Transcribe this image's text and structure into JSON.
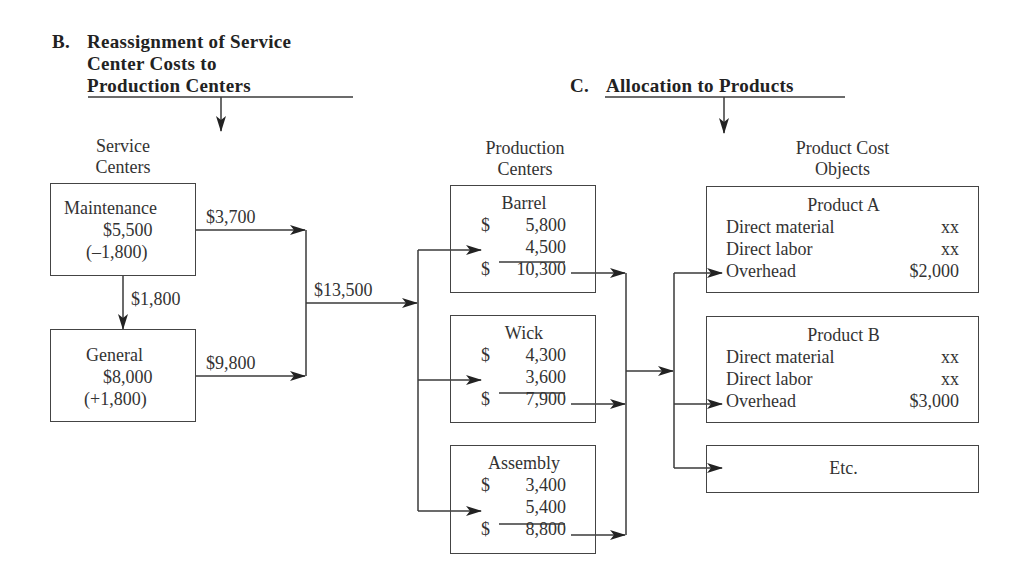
{
  "section_b": {
    "letter": "B.",
    "title_lines": [
      "Reassignment of Service",
      "Center Costs to",
      "Production Centers"
    ]
  },
  "section_c": {
    "letter": "C.",
    "title": "Allocation to Products"
  },
  "columns": {
    "service_centers": [
      "Service",
      "Centers"
    ],
    "production_centers": [
      "Production",
      "Centers"
    ],
    "product_cost_objects": [
      "Product Cost",
      "Objects"
    ]
  },
  "service_centers": [
    {
      "name": "Maintenance",
      "amount": "$5,500",
      "adjustment": "(–1,800)"
    },
    {
      "name": "General",
      "amount": "$8,000",
      "adjustment": "(+1,800)"
    }
  ],
  "flows": {
    "maintenance_to_general": "$1,800",
    "maintenance_to_production": "$3,700",
    "general_to_production": "$9,800",
    "total_to_production": "$13,500"
  },
  "production_centers": [
    {
      "name": "Barrel",
      "dollar1": "$",
      "direct": "5,800",
      "allocated": "4,500",
      "dollar2": "$",
      "total": "10,300"
    },
    {
      "name": "Wick",
      "dollar1": "$",
      "direct": "4,300",
      "allocated": "3,600",
      "dollar2": "$",
      "total": "7,900"
    },
    {
      "name": "Assembly",
      "dollar1": "$",
      "direct": "3,400",
      "allocated": "5,400",
      "dollar2": "$",
      "total": "8,800"
    }
  ],
  "products": [
    {
      "name": "Product A",
      "rows": [
        {
          "label": "Direct material",
          "value": "xx"
        },
        {
          "label": "Direct labor",
          "value": "xx"
        },
        {
          "label": "Overhead",
          "value": "$2,000"
        }
      ]
    },
    {
      "name": "Product B",
      "rows": [
        {
          "label": "Direct material",
          "value": "xx"
        },
        {
          "label": "Direct labor",
          "value": "xx"
        },
        {
          "label": "Overhead",
          "value": "$3,000"
        }
      ]
    }
  ],
  "etc_box": {
    "label": "Etc."
  },
  "colors": {
    "line": "#3a3a3a",
    "text": "#2a2a2a",
    "background": "#ffffff"
  }
}
